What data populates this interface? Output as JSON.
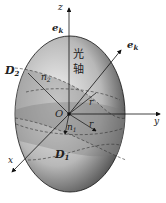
{
  "diagram": {
    "type": "index-ellipsoid",
    "labels": {
      "z_axis": "z",
      "y_axis": "y",
      "x_axis": "x",
      "origin": "O",
      "ek_top": "e",
      "ek_top_sub": "k",
      "ek_right": "e",
      "ek_right_sub": "k",
      "optic_axis_1": "光",
      "optic_axis_2": "轴",
      "D2": "D",
      "D2_sub": "2",
      "D1": "D",
      "D1_sub": "1",
      "n2": "n",
      "n2_sub": "2",
      "n1": "n",
      "n1_sub": "1",
      "r_upper": "r",
      "r_lower": "r"
    },
    "colors": {
      "ellipsoid_light": "#f2f2f2",
      "ellipsoid_dark": "#3a3a3a",
      "section": "#9a9a9a",
      "line": "#111111"
    }
  }
}
